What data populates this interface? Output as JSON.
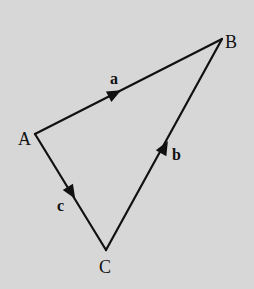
{
  "diagram": {
    "points": {
      "A": {
        "label": "A",
        "x": 35,
        "y": 134
      },
      "B": {
        "label": "B",
        "x": 222,
        "y": 39
      },
      "C": {
        "label": "C",
        "x": 106,
        "y": 250
      }
    },
    "edges": [
      {
        "from": "A",
        "to": "B",
        "label": "a"
      },
      {
        "from": "C",
        "to": "B",
        "label": "b"
      },
      {
        "from": "A",
        "to": "C",
        "label": "c"
      }
    ],
    "colors": {
      "background": "#d7d7d7",
      "ink": "#111111"
    }
  }
}
